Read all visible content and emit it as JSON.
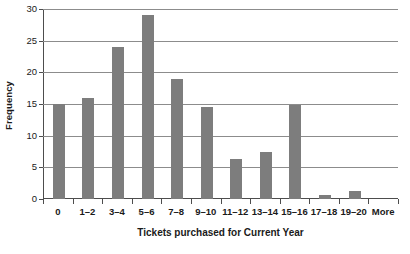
{
  "chart_data": {
    "type": "bar",
    "title": "",
    "xlabel": "Tickets purchased for Current Year",
    "ylabel": "Frequency",
    "categories": [
      "0",
      "1–2",
      "3–4",
      "5–6",
      "7–8",
      "9–10",
      "11–12",
      "13–14",
      "15–16",
      "17–18",
      "19–20",
      "More"
    ],
    "values": [
      15,
      16,
      24,
      29,
      19,
      14.5,
      6.3,
      7.5,
      14.8,
      0.7,
      1.3,
      0
    ],
    "ylim": [
      0,
      30
    ],
    "xlim": [
      0,
      12
    ],
    "y_ticks": [
      0,
      5,
      10,
      15,
      20,
      25,
      30
    ],
    "y_tick_labels": [
      "0",
      "5",
      "10",
      "15",
      "20",
      "25",
      "30"
    ],
    "grid": "horizontal",
    "legend": "none",
    "bar_color": "#7d7d7d",
    "gridline_color": "#8c8c8c",
    "axis_color": "#4d4d4d",
    "background_color": "#ffffff"
  }
}
